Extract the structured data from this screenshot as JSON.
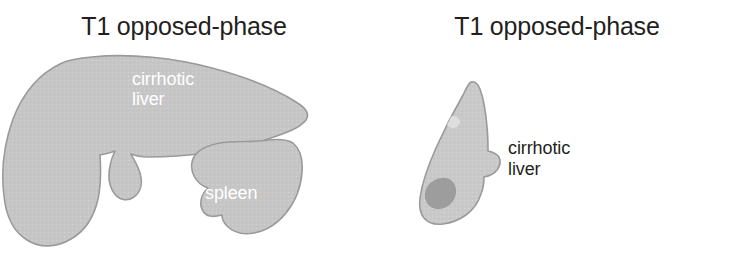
{
  "figure": {
    "background_color": "#ffffff",
    "organ_fill_color": "#c6c6c6",
    "organ_outline_color": "#9a9a9a",
    "lesion_dark_color": "#9d9d9d",
    "lesion_light_color": "#dedede",
    "inset_label_color": "#ffffff",
    "text_color": "#231f20"
  },
  "panels": [
    {
      "id": "left",
      "title": "T1 opposed-phase",
      "labels": [
        {
          "name": "cirrhotic-liver",
          "line1": "cirrhotic",
          "line2": "liver",
          "style": "inset"
        },
        {
          "name": "spleen",
          "line1": "spleen",
          "line2": "",
          "style": "inset"
        }
      ]
    },
    {
      "id": "right",
      "title": "T1 opposed-phase",
      "labels": [
        {
          "name": "cirrhotic-liver",
          "line1": "cirrhotic",
          "line2": "liver",
          "style": "outset"
        }
      ]
    }
  ]
}
